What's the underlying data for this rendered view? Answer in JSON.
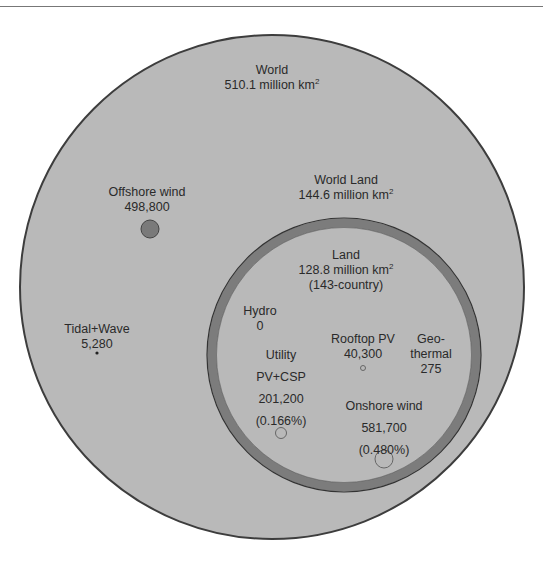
{
  "world": {
    "label": "World",
    "area_value": "510.1 million km",
    "sup": "2"
  },
  "world_land": {
    "label": "World Land",
    "area_value": "144.6 million km",
    "sup": "2"
  },
  "land": {
    "label": "Land",
    "area_value": "128.8 million km",
    "sup": "2",
    "note": "(143-country)"
  },
  "offshore_wind": {
    "label": "Offshore wind",
    "value": "498,800"
  },
  "tidal_wave": {
    "label": "Tidal+Wave",
    "value": "5,280"
  },
  "hydro": {
    "label": "Hydro",
    "value": "0"
  },
  "rooftop_pv": {
    "label": "Rooftop PV",
    "value": "40,300"
  },
  "geothermal": {
    "label_line1": "Geo-",
    "label_line2": "thermal",
    "value": "275"
  },
  "utility_pv": {
    "label_line1": "Utility",
    "label_line2": "PV+CSP",
    "value": "201,200",
    "percent": "(0.166%)"
  },
  "onshore_wind": {
    "label": "Onshore wind",
    "value": "581,700",
    "percent": "(0.480%)"
  },
  "colors": {
    "world_fill": "#b9b9b9",
    "ring": "#7c7c7c",
    "outline": "#3a3a3a",
    "offshore_dot": "#7a7a7a"
  }
}
